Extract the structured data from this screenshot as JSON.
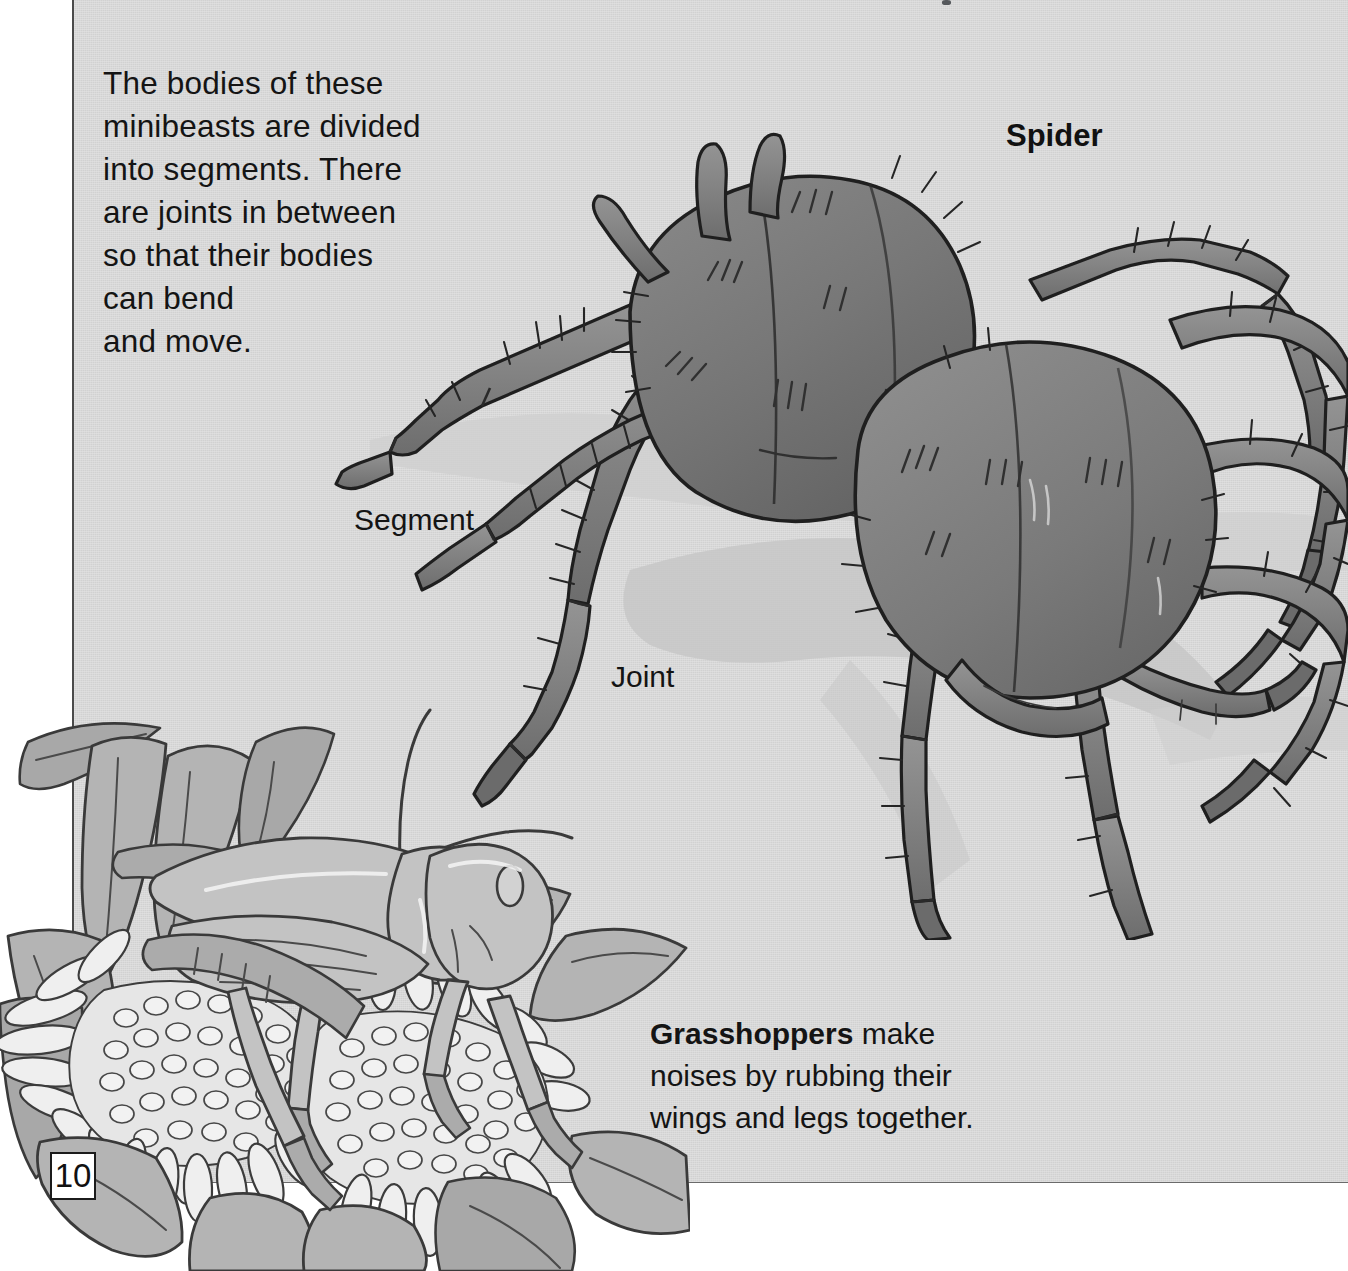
{
  "page": {
    "number": "10",
    "background_color": "#d6d6d6",
    "margin_color": "#ffffff",
    "edge_line_color": "#4a4a4a"
  },
  "intro": {
    "paragraph": "The bodies of these\nminibeasts are divided\ninto segments. There\nare joints in between\nso that their bodies\ncan bend\nand move."
  },
  "labels": {
    "spider": "Spider",
    "segment": "Segment",
    "joint": "Joint"
  },
  "caption": {
    "bold_lead": "Grasshoppers",
    "rest": " make\nnoises by rubbing their\nwings and legs together."
  },
  "illustrations": {
    "spider": {
      "name": "tarantula-spider",
      "body_color": "#7d7d7d",
      "body_shade": "#6a6a6a",
      "leg_color": "#838383",
      "outline_color": "#1f1f1f",
      "shadow_color": "#c4c4c4"
    },
    "grasshopper": {
      "name": "grasshopper-on-flowers",
      "body_color": "#bdbdbd",
      "petal_color": "#f0f0f0",
      "leaf_color": "#b3b3b3",
      "outline_color": "#3a3a3a"
    }
  }
}
